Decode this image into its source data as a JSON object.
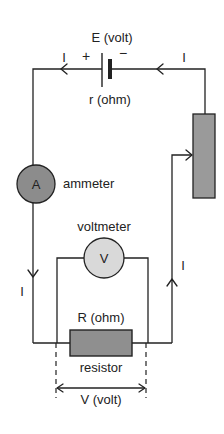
{
  "diagram": {
    "type": "electric-circuit",
    "battery": {
      "emf_label": "E (volt)",
      "internal_resistance_label": "r (ohm)",
      "positive_sign": "+",
      "negative_sign": "−"
    },
    "ammeter": {
      "symbol": "A",
      "label": "ammeter",
      "color": "#8c8c8c"
    },
    "voltmeter": {
      "symbol": "V",
      "label": "voltmeter",
      "color": "#d9d9d9"
    },
    "resistor": {
      "value_label": "R (ohm)",
      "label": "resistor",
      "color": "#8f8f8f"
    },
    "rheostat": {
      "color": "#9a9a9a"
    },
    "voltage_across": {
      "label": "V (volt)"
    },
    "current_labels": [
      "I",
      "I",
      "I",
      "I"
    ]
  }
}
